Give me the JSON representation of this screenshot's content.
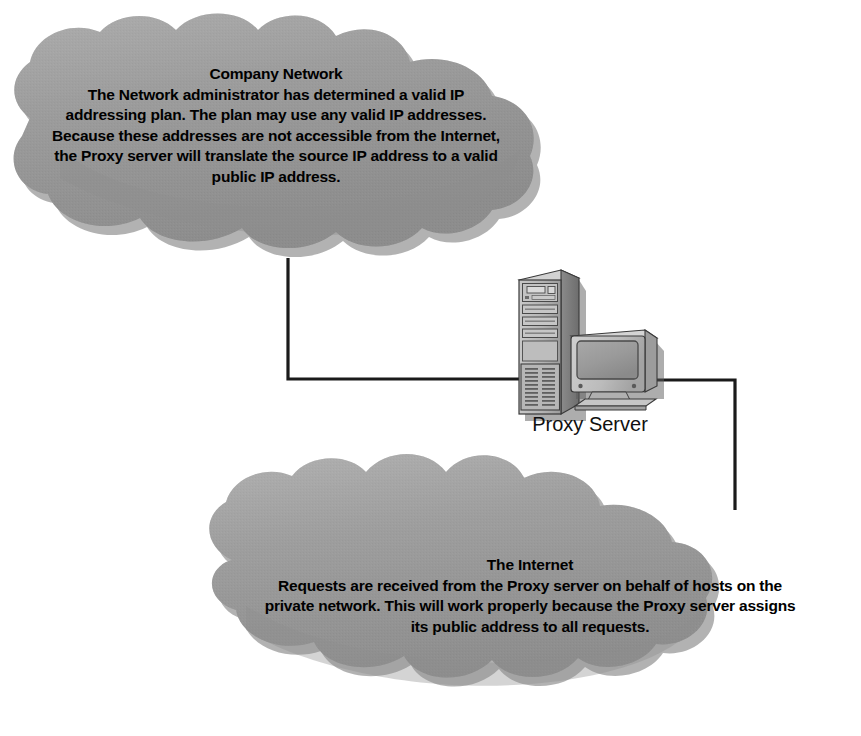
{
  "diagram": {
    "background_color": "#ffffff",
    "cloud_fill_color": "#9a9a9a",
    "cloud_shadow_color": "#6f6f6f",
    "line_color": "#1a1a1a",
    "text_color": "#000000"
  },
  "nodes": {
    "company_network": {
      "type": "cloud",
      "title": "Company Network",
      "body": "The Network administrator has determined a valid IP addressing plan. The plan may use any valid IP addresses. Because these addresses are not accessible from the Internet, the Proxy server will translate the source IP address to a valid public IP address.",
      "lines": [
        "Company Network",
        "The Network administrator has determined a valid IP",
        "addressing plan. The plan may use any valid IP addresses.",
        "Because these addresses are not accessible from the Internet,",
        "the Proxy server will translate the source IP address to a valid",
        "public IP address."
      ]
    },
    "proxy_server": {
      "type": "computer",
      "label": "Proxy Server",
      "icon": "tower-and-monitor-icon"
    },
    "internet": {
      "type": "cloud",
      "title": "The Internet",
      "body": "Requests are received from the Proxy server on behalf of hosts on the private network. This will work properly because the Proxy server assigns its public address to all requests.",
      "lines": [
        "The Internet",
        "Requests are received from the Proxy server on behalf of hosts on the",
        "private network. This will work properly because the Proxy server assigns",
        "its public address to all requests."
      ]
    }
  },
  "links": [
    {
      "id": "company-to-proxy",
      "from": "company_network",
      "to": "proxy_server",
      "style": "orthogonal"
    },
    {
      "id": "proxy-to-internet",
      "from": "proxy_server",
      "to": "internet",
      "style": "orthogonal"
    }
  ]
}
